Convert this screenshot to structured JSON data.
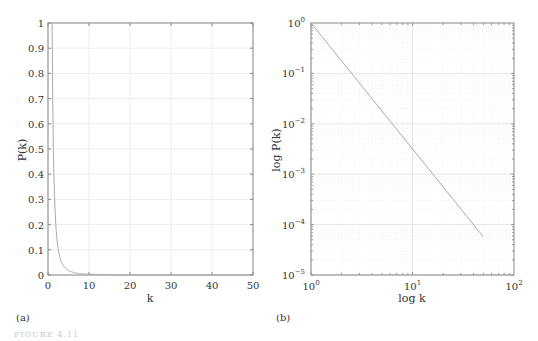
{
  "figure_caption": "FIGURE 4.11",
  "chart_data": [
    {
      "panel_label": "(a)",
      "type": "line",
      "title": "",
      "xlabel": "k",
      "ylabel": "P(k)",
      "xlim": [
        0,
        50
      ],
      "ylim": [
        0,
        1
      ],
      "xticks": [
        "0",
        "10",
        "20",
        "30",
        "40",
        "50"
      ],
      "yticks": [
        "0",
        "0.1",
        "0.2",
        "0.3",
        "0.4",
        "0.5",
        "0.6",
        "0.7",
        "0.8",
        "0.9",
        "1"
      ],
      "grid": true,
      "series": [
        {
          "name": "P(k) = k^-2.5",
          "x": [
            1,
            2,
            3,
            4,
            5,
            6,
            7,
            8,
            10,
            15,
            20,
            30,
            40,
            50
          ],
          "y": [
            1.0,
            0.177,
            0.064,
            0.031,
            0.018,
            0.011,
            0.0077,
            0.0055,
            0.0032,
            0.0011,
            0.00056,
            0.0002,
            0.0001,
            5.7e-05
          ]
        }
      ]
    },
    {
      "panel_label": "(b)",
      "type": "line",
      "title": "",
      "xlabel": "log k",
      "ylabel": "log P(k)",
      "xscale": "log",
      "yscale": "log",
      "xlim": [
        1,
        100
      ],
      "ylim": [
        1e-05,
        1
      ],
      "xticks": [
        "10^0",
        "10^1",
        "10^2"
      ],
      "yticks": [
        "10^-5",
        "10^-4",
        "10^-3",
        "10^-2",
        "10^-1",
        "10^0"
      ],
      "grid": true,
      "series": [
        {
          "name": "P(k) = k^-2.5",
          "x": [
            1,
            50
          ],
          "y": [
            1.0,
            5.7e-05
          ]
        }
      ]
    }
  ]
}
